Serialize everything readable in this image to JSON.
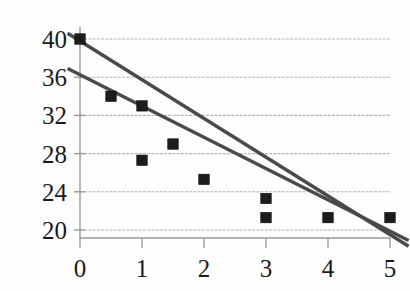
{
  "chart_data": {
    "type": "scatter",
    "title": "",
    "subtitle": "",
    "xlabel": "",
    "ylabel": "",
    "xlim": [
      0,
      5
    ],
    "ylim": [
      20,
      40
    ],
    "xticks": [
      "0",
      "1",
      "2",
      "3",
      "4",
      "5"
    ],
    "xtick_values": [
      0,
      1,
      2,
      3,
      4,
      5
    ],
    "yticks": [
      "20",
      "24",
      "28",
      "32",
      "36",
      "40"
    ],
    "ytick_values": [
      20,
      24,
      28,
      32,
      36,
      40
    ],
    "grid": "horizontal",
    "legend": "none",
    "marker": "filled-square",
    "marker_color": "#1c1c1c",
    "line_color": "#4a4a4a",
    "grid_color": "#a8a8a8",
    "axis_color": "#9a9a9a",
    "background": "#fefefe",
    "series": [
      {
        "name": "data points",
        "type": "scatter",
        "points": [
          {
            "x": 0,
            "y": 40.0
          },
          {
            "x": 0.5,
            "y": 34.0
          },
          {
            "x": 1,
            "y": 33.0
          },
          {
            "x": 1,
            "y": 27.3
          },
          {
            "x": 1.5,
            "y": 29.0
          },
          {
            "x": 2,
            "y": 25.3
          },
          {
            "x": 3,
            "y": 23.3
          },
          {
            "x": 3,
            "y": 21.3
          },
          {
            "x": 4,
            "y": 21.3
          },
          {
            "x": 5,
            "y": 21.3
          }
        ]
      },
      {
        "name": "trend line upper",
        "type": "line",
        "points": [
          {
            "x": -0.2,
            "y": 40.6
          },
          {
            "x": 5.3,
            "y": 18.3
          }
        ]
      },
      {
        "name": "trend line lower",
        "type": "line",
        "points": [
          {
            "x": -0.2,
            "y": 36.9
          },
          {
            "x": 5.3,
            "y": 18.9
          }
        ]
      }
    ]
  }
}
